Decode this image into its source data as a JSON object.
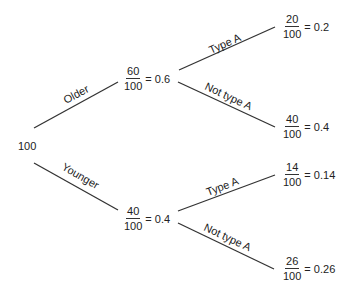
{
  "diagram": {
    "type": "probability-tree",
    "root": {
      "label": "100"
    },
    "level1": [
      {
        "branch_label": "Older",
        "numerator": "60",
        "denominator": "100",
        "result": "= 0.6"
      },
      {
        "branch_label": "Younger",
        "numerator": "40",
        "denominator": "100",
        "result": "= 0.4"
      }
    ],
    "level2": [
      {
        "parent": "Older",
        "branch_label": "Type A",
        "numerator": "20",
        "denominator": "100",
        "result": "= 0.2"
      },
      {
        "parent": "Older",
        "branch_label": "Not type A",
        "numerator": "40",
        "denominator": "100",
        "result": "= 0.4"
      },
      {
        "parent": "Younger",
        "branch_label": "Type A",
        "numerator": "14",
        "denominator": "100",
        "result": "= 0.14"
      },
      {
        "parent": "Younger",
        "branch_label": "Not type A",
        "numerator": "26",
        "denominator": "100",
        "result": "= 0.26"
      }
    ]
  }
}
